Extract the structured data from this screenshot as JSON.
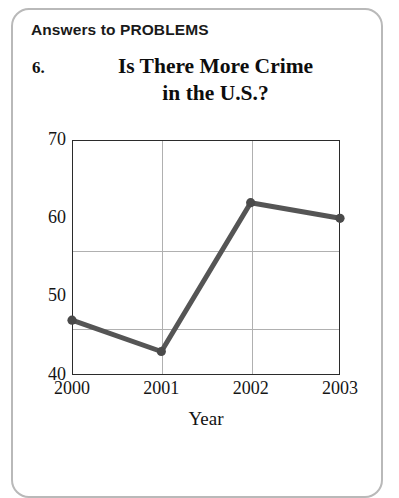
{
  "page": {
    "header": "Answers to PROBLEMS",
    "problem_number": "6.",
    "title_line1": "Is There More Crime",
    "title_line2": "in the U.S.?"
  },
  "chart_data": {
    "type": "line",
    "title": "Is There More Crime in the U.S.?",
    "xlabel": "Year",
    "ylabel": "",
    "categories": [
      "2000",
      "2001",
      "2002",
      "2003"
    ],
    "values": [
      47,
      43,
      62,
      60
    ],
    "x": [
      2000,
      2001,
      2002,
      2003
    ],
    "xlim": [
      2000,
      2003
    ],
    "ylim": [
      40,
      70
    ],
    "yticks": [
      "40",
      "50",
      "60",
      "70"
    ],
    "ytick_values": [
      40,
      50,
      60,
      70
    ],
    "xticks": [
      "2000",
      "2001",
      "2002",
      "2003"
    ],
    "grid": true,
    "legend": false,
    "series": [
      {
        "name": "Crime rate",
        "values": [
          47,
          43,
          62,
          60
        ],
        "color": "#555555",
        "marker": "circle"
      }
    ],
    "colors": {
      "line": "#555555",
      "marker": "#4a4a4a",
      "grid": "#b0b0b0",
      "frame": "#2b2b2b",
      "text": "#151515",
      "page_border": "#b9b9b9"
    }
  }
}
